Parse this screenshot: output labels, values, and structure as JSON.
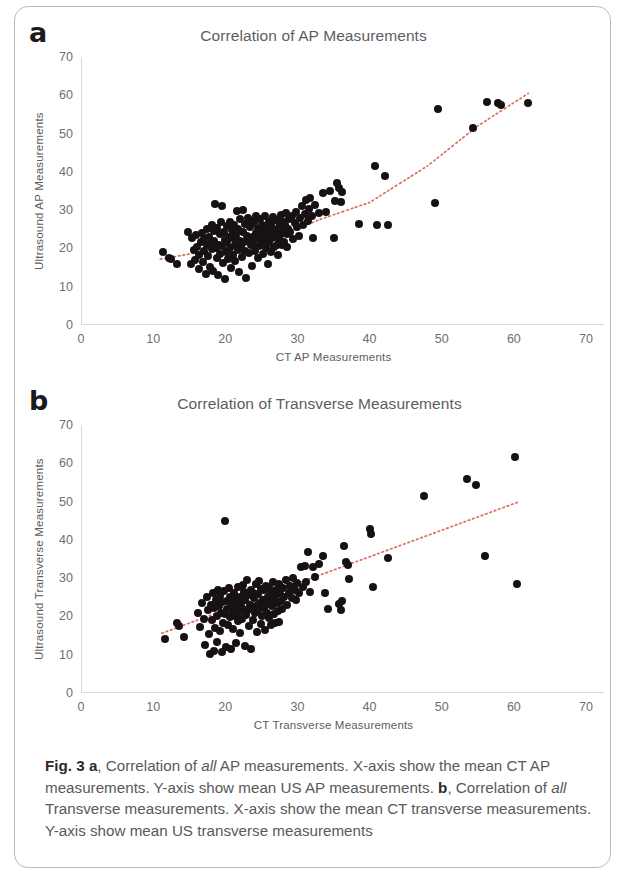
{
  "figure": {
    "caption_label": "Fig. 3",
    "caption_a_marker": "a",
    "caption_a_pre": ", Correlation of ",
    "caption_a_em": "all",
    "caption_a_post": " AP measurements. X-axis show the mean CT AP measurements. Y-axis show mean US AP measurements. ",
    "caption_b_marker": "b",
    "caption_b_pre": ", Correlation of ",
    "caption_b_em": "all",
    "caption_b_post": " Transverse measurements. X-axis show the mean CT transverse measurements. Y-axis show mean US transverse measurements",
    "accent_trendline_color": "#d9705f",
    "marker_color": "#181114",
    "axis_color": "#d8d9da"
  },
  "chart_data": [
    {
      "panel": "a",
      "type": "scatter",
      "title": "Correlation of AP Measurements",
      "xlabel": "CT AP Measurements",
      "ylabel": "Ultrasound AP Measurements",
      "xlim": [
        0,
        70
      ],
      "ylim": [
        0,
        70
      ],
      "xticks": [
        0,
        10,
        20,
        30,
        40,
        50,
        60,
        70
      ],
      "yticks": [
        0,
        10,
        20,
        30,
        40,
        50,
        60,
        70
      ],
      "grid": false,
      "legend": "none",
      "trendline": {
        "style": "dotted",
        "color": "#d9705f",
        "shape": "curved",
        "points": [
          [
            11.0,
            17.2
          ],
          [
            20.0,
            20.2
          ],
          [
            28.0,
            23.5
          ],
          [
            33.0,
            27.5
          ],
          [
            40.0,
            32.0
          ],
          [
            48.0,
            41.5
          ],
          [
            55.0,
            52.0
          ],
          [
            62.0,
            60.5
          ]
        ]
      },
      "points": [
        [
          11.3,
          19.0
        ],
        [
          12.2,
          17.4
        ],
        [
          12.5,
          17.2
        ],
        [
          13.3,
          16.0
        ],
        [
          14.9,
          24.3
        ],
        [
          15.2,
          15.9
        ],
        [
          15.4,
          22.8
        ],
        [
          15.6,
          19.5
        ],
        [
          15.8,
          17.0
        ],
        [
          16.0,
          23.4
        ],
        [
          16.1,
          20.5
        ],
        [
          16.3,
          18.2
        ],
        [
          16.4,
          14.6
        ],
        [
          16.6,
          21.7
        ],
        [
          16.8,
          24.0
        ],
        [
          16.9,
          16.4
        ],
        [
          17.0,
          19.2
        ],
        [
          17.1,
          22.5
        ],
        [
          17.3,
          13.4
        ],
        [
          17.4,
          20.8
        ],
        [
          17.5,
          25.0
        ],
        [
          17.6,
          18.0
        ],
        [
          17.8,
          23.1
        ],
        [
          17.9,
          15.2
        ],
        [
          18.0,
          21.3
        ],
        [
          18.1,
          26.2
        ],
        [
          18.2,
          19.8
        ],
        [
          18.3,
          14.0
        ],
        [
          18.4,
          22.0
        ],
        [
          18.5,
          24.6
        ],
        [
          18.6,
          31.7
        ],
        [
          18.7,
          20.2
        ],
        [
          18.8,
          17.6
        ],
        [
          18.9,
          25.4
        ],
        [
          19.0,
          13.0
        ],
        [
          19.1,
          21.0
        ],
        [
          19.2,
          23.8
        ],
        [
          19.3,
          18.6
        ],
        [
          19.4,
          26.8
        ],
        [
          19.5,
          31.0
        ],
        [
          19.6,
          20.6
        ],
        [
          19.7,
          16.2
        ],
        [
          19.8,
          24.2
        ],
        [
          19.9,
          22.2
        ],
        [
          20.0,
          12.0
        ],
        [
          20.1,
          19.0
        ],
        [
          20.2,
          25.8
        ],
        [
          20.3,
          21.6
        ],
        [
          20.4,
          17.2
        ],
        [
          20.5,
          23.0
        ],
        [
          20.6,
          27.0
        ],
        [
          20.7,
          20.0
        ],
        [
          20.8,
          14.8
        ],
        [
          20.9,
          24.8
        ],
        [
          21.0,
          22.6
        ],
        [
          21.1,
          18.4
        ],
        [
          21.2,
          26.0
        ],
        [
          21.3,
          21.0
        ],
        [
          21.4,
          16.8
        ],
        [
          21.5,
          23.6
        ],
        [
          21.6,
          29.8
        ],
        [
          21.7,
          19.6
        ],
        [
          21.8,
          25.2
        ],
        [
          21.9,
          13.8
        ],
        [
          22.0,
          22.0
        ],
        [
          22.1,
          27.6
        ],
        [
          22.2,
          20.4
        ],
        [
          22.3,
          17.8
        ],
        [
          22.4,
          24.4
        ],
        [
          22.5,
          30.0
        ],
        [
          22.6,
          21.8
        ],
        [
          22.7,
          26.4
        ],
        [
          22.8,
          19.2
        ],
        [
          22.9,
          12.2
        ],
        [
          23.0,
          23.2
        ],
        [
          23.1,
          28.0
        ],
        [
          23.2,
          22.4
        ],
        [
          23.3,
          18.8
        ],
        [
          23.4,
          25.6
        ],
        [
          23.5,
          20.8
        ],
        [
          23.6,
          27.2
        ],
        [
          23.7,
          15.4
        ],
        [
          23.8,
          23.0
        ],
        [
          23.9,
          21.2
        ],
        [
          24.0,
          26.6
        ],
        [
          24.1,
          19.4
        ],
        [
          24.2,
          24.0
        ],
        [
          24.3,
          28.4
        ],
        [
          24.4,
          22.8
        ],
        [
          24.5,
          17.4
        ],
        [
          24.6,
          25.0
        ],
        [
          24.7,
          20.6
        ],
        [
          24.8,
          27.8
        ],
        [
          24.9,
          23.4
        ],
        [
          25.0,
          21.4
        ],
        [
          25.1,
          26.0
        ],
        [
          25.2,
          18.6
        ],
        [
          25.3,
          24.6
        ],
        [
          25.4,
          22.0
        ],
        [
          25.5,
          28.6
        ],
        [
          25.6,
          20.0
        ],
        [
          25.7,
          25.4
        ],
        [
          25.8,
          23.2
        ],
        [
          25.9,
          16.0
        ],
        [
          26.0,
          27.0
        ],
        [
          26.1,
          21.8
        ],
        [
          26.2,
          24.2
        ],
        [
          26.3,
          19.0
        ],
        [
          26.4,
          26.4
        ],
        [
          26.5,
          22.6
        ],
        [
          26.6,
          28.2
        ],
        [
          26.7,
          20.4
        ],
        [
          26.8,
          24.8
        ],
        [
          26.9,
          23.0
        ],
        [
          27.0,
          27.4
        ],
        [
          27.1,
          21.0
        ],
        [
          27.2,
          25.2
        ],
        [
          27.3,
          18.2
        ],
        [
          27.4,
          26.8
        ],
        [
          27.5,
          23.6
        ],
        [
          27.6,
          22.2
        ],
        [
          27.7,
          28.8
        ],
        [
          27.8,
          20.8
        ],
        [
          27.9,
          25.8
        ],
        [
          28.0,
          24.0
        ],
        [
          28.1,
          27.0
        ],
        [
          28.2,
          21.6
        ],
        [
          28.3,
          26.2
        ],
        [
          28.4,
          29.2
        ],
        [
          28.5,
          23.8
        ],
        [
          28.6,
          20.5
        ],
        [
          28.7,
          25.0
        ],
        [
          28.8,
          27.6
        ],
        [
          29.0,
          24.4
        ],
        [
          29.2,
          28.4
        ],
        [
          29.4,
          22.4
        ],
        [
          29.6,
          26.6
        ],
        [
          29.8,
          29.6
        ],
        [
          30.0,
          25.6
        ],
        [
          30.2,
          23.2
        ],
        [
          30.4,
          28.0
        ],
        [
          30.6,
          31.0
        ],
        [
          30.8,
          26.0
        ],
        [
          31.0,
          29.0
        ],
        [
          31.2,
          32.6
        ],
        [
          31.4,
          27.2
        ],
        [
          31.6,
          30.2
        ],
        [
          31.8,
          33.2
        ],
        [
          32.0,
          28.6
        ],
        [
          32.2,
          22.8
        ],
        [
          32.5,
          31.4
        ],
        [
          33.0,
          29.2
        ],
        [
          33.5,
          34.6
        ],
        [
          34.0,
          29.4
        ],
        [
          34.5,
          35.0
        ],
        [
          35.0,
          22.8
        ],
        [
          35.2,
          32.4
        ],
        [
          35.5,
          37.0
        ],
        [
          35.8,
          35.8
        ],
        [
          36.0,
          32.0
        ],
        [
          36.2,
          34.8
        ],
        [
          38.5,
          26.4
        ],
        [
          40.8,
          41.4
        ],
        [
          41.0,
          26.2
        ],
        [
          42.2,
          39.0
        ],
        [
          42.5,
          26.2
        ],
        [
          49.0,
          31.8
        ],
        [
          49.5,
          56.5
        ],
        [
          54.3,
          51.5
        ],
        [
          56.3,
          58.2
        ],
        [
          57.8,
          57.9
        ],
        [
          58.2,
          57.4
        ],
        [
          62.0,
          58.0
        ]
      ]
    },
    {
      "panel": "b",
      "type": "scatter",
      "title": "Correlation of Transverse Measurements",
      "xlabel": "CT Transverse Measurements",
      "ylabel": "Ultrasound Transverse Measurements",
      "xlim": [
        0,
        70
      ],
      "ylim": [
        0,
        70
      ],
      "xticks": [
        0,
        10,
        20,
        30,
        40,
        50,
        60,
        70
      ],
      "yticks": [
        0,
        10,
        20,
        30,
        40,
        50,
        60,
        70
      ],
      "grid": false,
      "legend": "none",
      "trendline": {
        "style": "dotted",
        "color": "#d9705f",
        "shape": "linear",
        "points": [
          [
            11.2,
            15.6
          ],
          [
            60.5,
            49.8
          ]
        ]
      },
      "points": [
        [
          11.6,
          14.2
        ],
        [
          13.3,
          18.2
        ],
        [
          13.6,
          17.6
        ],
        [
          14.3,
          14.6
        ],
        [
          16.2,
          21.0
        ],
        [
          16.5,
          17.2
        ],
        [
          16.8,
          23.6
        ],
        [
          17.0,
          19.4
        ],
        [
          17.2,
          12.6
        ],
        [
          17.4,
          25.0
        ],
        [
          17.6,
          21.8
        ],
        [
          17.8,
          15.4
        ],
        [
          17.9,
          10.2
        ],
        [
          18.0,
          23.0
        ],
        [
          18.2,
          19.0
        ],
        [
          18.3,
          26.2
        ],
        [
          18.4,
          11.0
        ],
        [
          18.5,
          22.2
        ],
        [
          18.6,
          17.0
        ],
        [
          18.7,
          24.4
        ],
        [
          18.8,
          20.2
        ],
        [
          18.9,
          13.4
        ],
        [
          19.0,
          27.0
        ],
        [
          19.1,
          22.8
        ],
        [
          19.2,
          16.2
        ],
        [
          19.3,
          25.4
        ],
        [
          19.4,
          21.0
        ],
        [
          19.5,
          10.8
        ],
        [
          19.6,
          23.8
        ],
        [
          19.7,
          18.4
        ],
        [
          19.8,
          26.6
        ],
        [
          19.9,
          20.6
        ],
        [
          20.0,
          44.9
        ],
        [
          20.1,
          12.0
        ],
        [
          20.2,
          24.0
        ],
        [
          20.3,
          22.0
        ],
        [
          20.4,
          17.8
        ],
        [
          20.5,
          27.4
        ],
        [
          20.6,
          19.8
        ],
        [
          20.7,
          25.0
        ],
        [
          20.8,
          11.6
        ],
        [
          20.9,
          23.2
        ],
        [
          21.0,
          21.4
        ],
        [
          21.1,
          16.6
        ],
        [
          21.2,
          26.0
        ],
        [
          21.3,
          20.0
        ],
        [
          21.4,
          24.6
        ],
        [
          21.5,
          13.0
        ],
        [
          21.6,
          22.6
        ],
        [
          21.7,
          18.8
        ],
        [
          21.8,
          27.8
        ],
        [
          21.9,
          21.2
        ],
        [
          22.0,
          25.2
        ],
        [
          22.1,
          15.8
        ],
        [
          22.2,
          23.4
        ],
        [
          22.3,
          19.4
        ],
        [
          22.4,
          28.2
        ],
        [
          22.5,
          22.0
        ],
        [
          22.6,
          26.4
        ],
        [
          22.7,
          12.4
        ],
        [
          22.8,
          24.2
        ],
        [
          22.9,
          20.4
        ],
        [
          23.0,
          29.6
        ],
        [
          23.1,
          21.8
        ],
        [
          23.2,
          25.6
        ],
        [
          23.3,
          17.4
        ],
        [
          23.4,
          23.0
        ],
        [
          23.5,
          27.0
        ],
        [
          23.6,
          11.4
        ],
        [
          23.7,
          22.4
        ],
        [
          23.8,
          19.0
        ],
        [
          23.9,
          26.0
        ],
        [
          24.0,
          24.8
        ],
        [
          24.1,
          20.8
        ],
        [
          24.2,
          28.6
        ],
        [
          24.3,
          22.8
        ],
        [
          24.4,
          16.0
        ],
        [
          24.5,
          25.8
        ],
        [
          24.6,
          21.6
        ],
        [
          24.7,
          29.2
        ],
        [
          24.8,
          23.6
        ],
        [
          24.9,
          18.0
        ],
        [
          25.0,
          27.2
        ],
        [
          25.1,
          20.2
        ],
        [
          25.2,
          24.4
        ],
        [
          25.3,
          22.2
        ],
        [
          25.4,
          26.8
        ],
        [
          25.5,
          16.4
        ],
        [
          25.6,
          23.8
        ],
        [
          25.7,
          28.0
        ],
        [
          25.8,
          21.0
        ],
        [
          25.9,
          25.2
        ],
        [
          26.0,
          19.6
        ],
        [
          26.1,
          27.6
        ],
        [
          26.2,
          23.2
        ],
        [
          26.3,
          17.8
        ],
        [
          26.4,
          26.2
        ],
        [
          26.5,
          22.6
        ],
        [
          26.6,
          29.0
        ],
        [
          26.7,
          20.6
        ],
        [
          26.8,
          24.6
        ],
        [
          26.9,
          18.2
        ],
        [
          27.0,
          27.0
        ],
        [
          27.1,
          23.4
        ],
        [
          27.2,
          25.8
        ],
        [
          27.3,
          21.4
        ],
        [
          27.4,
          28.4
        ],
        [
          27.5,
          18.6
        ],
        [
          27.6,
          26.6
        ],
        [
          27.7,
          24.0
        ],
        [
          27.8,
          22.0
        ],
        [
          28.0,
          27.4
        ],
        [
          28.2,
          25.0
        ],
        [
          28.4,
          29.4
        ],
        [
          28.6,
          23.0
        ],
        [
          28.8,
          26.0
        ],
        [
          29.0,
          28.0
        ],
        [
          29.2,
          24.8
        ],
        [
          29.4,
          30.0
        ],
        [
          29.6,
          26.8
        ],
        [
          29.8,
          24.2
        ],
        [
          30.0,
          28.8
        ],
        [
          30.2,
          26.2
        ],
        [
          30.5,
          32.8
        ],
        [
          30.8,
          27.8
        ],
        [
          31.0,
          33.2
        ],
        [
          31.2,
          29.0
        ],
        [
          31.5,
          36.8
        ],
        [
          31.8,
          26.4
        ],
        [
          32.2,
          33.0
        ],
        [
          32.5,
          30.2
        ],
        [
          33.0,
          33.6
        ],
        [
          33.5,
          35.8
        ],
        [
          33.8,
          26.2
        ],
        [
          34.2,
          22.0
        ],
        [
          35.8,
          23.2
        ],
        [
          36.0,
          21.6
        ],
        [
          36.2,
          24.0
        ],
        [
          36.5,
          38.4
        ],
        [
          36.8,
          34.2
        ],
        [
          37.0,
          33.4
        ],
        [
          37.2,
          29.8
        ],
        [
          40.0,
          42.8
        ],
        [
          40.2,
          41.6
        ],
        [
          40.5,
          27.6
        ],
        [
          42.5,
          35.2
        ],
        [
          47.6,
          51.4
        ],
        [
          53.5,
          56.0
        ],
        [
          54.8,
          54.4
        ],
        [
          56.0,
          35.8
        ],
        [
          60.2,
          61.6
        ],
        [
          60.5,
          28.4
        ]
      ]
    }
  ]
}
